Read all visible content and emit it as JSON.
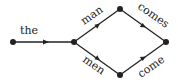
{
  "diagram": {
    "type": "word-lattice",
    "colors": {
      "stroke": "#222222",
      "background": "#ffffff"
    },
    "nodes": [
      {
        "id": "start",
        "x": 13,
        "y": 42
      },
      {
        "id": "branch",
        "x": 74,
        "y": 42
      },
      {
        "id": "top",
        "x": 120,
        "y": 9
      },
      {
        "id": "bottom",
        "x": 120,
        "y": 75
      },
      {
        "id": "end",
        "x": 166,
        "y": 42
      }
    ],
    "edges": [
      {
        "from": "start",
        "to": "branch",
        "label": "the"
      },
      {
        "from": "branch",
        "to": "top",
        "label": "man"
      },
      {
        "from": "branch",
        "to": "bottom",
        "label": "men"
      },
      {
        "from": "top",
        "to": "end",
        "label": "comes"
      },
      {
        "from": "bottom",
        "to": "end",
        "label": "come"
      }
    ]
  }
}
